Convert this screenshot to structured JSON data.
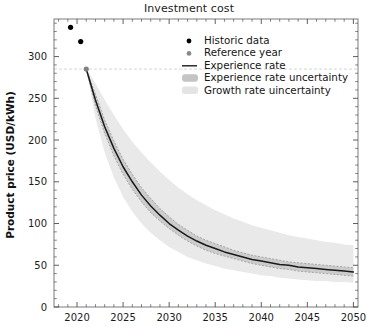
{
  "chart_data": {
    "type": "line",
    "title": "Investment cost",
    "xlabel": "",
    "ylabel": "Product price (USD/kWh)",
    "xlim": [
      2017.5,
      2050.5
    ],
    "ylim": [
      0,
      345
    ],
    "xticks": [
      2020,
      2025,
      2030,
      2035,
      2040,
      2045,
      2050
    ],
    "xtick_labels": [
      "2020",
      "2025",
      "2030",
      "2035",
      "2040",
      "2045",
      "2050"
    ],
    "yticks": [
      0,
      50,
      100,
      150,
      200,
      250,
      300
    ],
    "ytick_labels": [
      "0",
      "50",
      "100",
      "150",
      "200",
      "250",
      "300"
    ],
    "minor_ticks": true,
    "grid": false,
    "legend_position": "upper right",
    "reference_line": {
      "orientation": "horizontal",
      "value": 285,
      "style": "dashed",
      "color": "#c9c9c9"
    },
    "series": [
      {
        "name": "Historic data",
        "type": "scatter",
        "marker": "circle",
        "color": "#000000",
        "points": [
          {
            "x": 2019.3,
            "y": 335
          },
          {
            "x": 2020.4,
            "y": 318
          }
        ]
      },
      {
        "name": "Reference year",
        "type": "scatter",
        "marker": "circle",
        "color": "#808080",
        "points": [
          {
            "x": 2021.0,
            "y": 285
          }
        ]
      },
      {
        "name": "Experience rate",
        "type": "line",
        "color": "#1a1a1a",
        "x": [
          2021,
          2022,
          2023,
          2024,
          2025,
          2026,
          2027,
          2028,
          2029,
          2030,
          2031,
          2032,
          2033,
          2034,
          2035,
          2036,
          2037,
          2038,
          2039,
          2040,
          2041,
          2042,
          2043,
          2044,
          2045,
          2046,
          2047,
          2048,
          2049,
          2050
        ],
        "y": [
          285,
          248,
          216,
          190,
          168,
          150,
          134,
          121,
          110,
          100,
          92,
          85,
          79,
          74,
          70,
          66,
          63,
          60,
          57,
          55,
          53,
          51,
          50,
          48,
          47,
          46,
          45,
          44,
          43,
          42
        ]
      },
      {
        "name": "Experience rate uncertainty",
        "type": "band",
        "color": "#b8b8b8",
        "opacity": 0.55,
        "x": [
          2021,
          2022,
          2023,
          2024,
          2025,
          2026,
          2027,
          2028,
          2029,
          2030,
          2031,
          2032,
          2033,
          2034,
          2035,
          2036,
          2037,
          2038,
          2039,
          2040,
          2041,
          2042,
          2043,
          2044,
          2045,
          2046,
          2047,
          2048,
          2049,
          2050
        ],
        "y_lower": [
          285,
          241,
          208,
          181,
          159,
          141,
          126,
          113,
          103,
          94,
          86,
          79,
          73,
          68,
          64,
          61,
          58,
          55,
          52,
          50,
          48,
          46,
          45,
          43,
          42,
          41,
          40,
          39,
          38,
          37
        ],
        "y_upper": [
          285,
          255,
          224,
          199,
          177,
          159,
          143,
          130,
          118,
          108,
          99,
          92,
          85,
          80,
          76,
          72,
          68,
          65,
          62,
          60,
          58,
          56,
          54,
          53,
          52,
          51,
          50,
          49,
          48,
          47
        ]
      },
      {
        "name": "Growth rate uincertainty",
        "type": "band",
        "color": "#e6e6e6",
        "opacity": 0.75,
        "x": [
          2021,
          2022,
          2023,
          2024,
          2025,
          2026,
          2027,
          2028,
          2029,
          2030,
          2031,
          2032,
          2033,
          2034,
          2035,
          2036,
          2037,
          2038,
          2039,
          2040,
          2041,
          2042,
          2043,
          2044,
          2045,
          2046,
          2047,
          2048,
          2049,
          2050
        ],
        "y_lower": [
          285,
          226,
          185,
          155,
          132,
          114,
          100,
          89,
          80,
          72,
          66,
          60,
          56,
          52,
          49,
          46,
          44,
          42,
          40,
          38,
          37,
          35,
          34,
          33,
          32,
          31,
          31,
          30,
          30,
          29
        ],
        "y_upper": [
          285,
          268,
          248,
          230,
          213,
          198,
          185,
          173,
          162,
          152,
          143,
          135,
          128,
          122,
          116,
          111,
          106,
          102,
          98,
          95,
          92,
          89,
          86,
          84,
          82,
          80,
          78,
          77,
          75,
          74
        ]
      }
    ],
    "legend": [
      {
        "label": "Historic data",
        "marker": "dot",
        "color": "#000000"
      },
      {
        "label": "Reference year",
        "marker": "dot",
        "color": "#8a8a8a"
      },
      {
        "label": "Experience rate",
        "marker": "line",
        "color": "#1a1a1a"
      },
      {
        "label": "Experience rate uncertainty",
        "marker": "patch",
        "color": "#c4c4c4"
      },
      {
        "label": "Growth rate uincertainty",
        "marker": "patch",
        "color": "#e4e4e4"
      }
    ]
  }
}
